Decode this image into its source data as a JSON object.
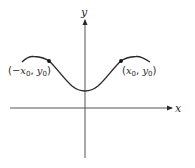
{
  "diagram": {
    "type": "function-graph",
    "axes": {
      "x_label": "x",
      "y_label": "y"
    },
    "curve": {
      "description": "even function, symmetric about y-axis, minimum on y-axis above x-axis",
      "color": "#2a2a2a"
    },
    "points": [
      {
        "label_open": "(",
        "label_x": "−x",
        "label_x_sub": "0",
        "label_sep": ", ",
        "label_y": "y",
        "label_y_sub": "0",
        "label_close": ")"
      },
      {
        "label_open": "(",
        "label_x": "x",
        "label_x_sub": "0",
        "label_sep": ", ",
        "label_y": "y",
        "label_y_sub": "0",
        "label_close": ")"
      }
    ]
  }
}
